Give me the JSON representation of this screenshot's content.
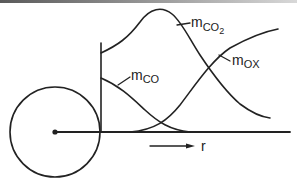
{
  "diagram": {
    "type": "concentration-profiles-around-particle",
    "labels": {
      "mco2": {
        "main": "m",
        "sub": "CO",
        "subsub": "2"
      },
      "mco": {
        "main": "m",
        "sub": "CO"
      },
      "mox": {
        "main": "m",
        "sub": "OX"
      },
      "r_axis": "r"
    },
    "elements": [
      "particle circle with center dot",
      "radial axis line",
      "vertical particle-surface line",
      "m_CO2 curve (peaked)",
      "m_CO curve (decaying from surface)",
      "m_ox curve (rising outward)",
      "arrow indicating increasing r"
    ],
    "colors": {
      "ink": "#222222",
      "background": "#ffffff"
    }
  }
}
